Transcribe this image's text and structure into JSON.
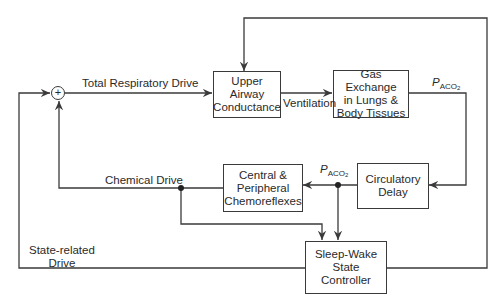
{
  "blocks": {
    "upper_airway": "Upper\nAirway\nConductance",
    "gas_exchange": "Gas Exchange\nin Lungs &\nBody Tissues",
    "circulatory_delay": "Circulatory\nDelay",
    "chemoreflexes": "Central &\nPeripheral\nChemoreflexes",
    "sleep_wake": "Sleep-Wake\nState\nController"
  },
  "signals": {
    "total_drive": "Total Respiratory Drive",
    "ventilation": "Ventilation",
    "chemical_drive": "Chemical Drive",
    "state_drive": "State-related\nDrive",
    "paco2_symbol": "P",
    "paco2_sub": "ACO",
    "paco2_subsub": "2"
  },
  "summing_junction": {
    "sign": "+"
  },
  "colors": {
    "line": "#3a3a3a",
    "background": "#ffffff"
  }
}
